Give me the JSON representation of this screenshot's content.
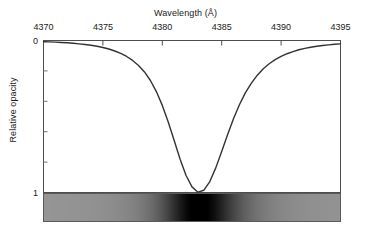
{
  "chart_data": {
    "type": "line",
    "title": "",
    "xlabel": "Wavelength (Å)",
    "ylabel": "Relative opacity",
    "xlim": [
      4370,
      4395
    ],
    "ylim": [
      0,
      1
    ],
    "y_axis_inverted": true,
    "grid": false,
    "legend": null,
    "x_tick_labels": [
      "4370",
      "4375",
      "4380",
      "4385",
      "4390",
      "4395"
    ],
    "x_ticks": [
      4370,
      4375,
      4380,
      4385,
      4390,
      4395
    ],
    "x_ticks_position": "top",
    "y_tick_labels": [
      "0",
      "1"
    ],
    "y_ticks": [
      0,
      1
    ],
    "y_minor_ticks": [
      0.2,
      0.4,
      0.6,
      0.8
    ],
    "line_color": "#333333",
    "series": [
      {
        "name": "Relative opacity",
        "line_center": 4383.0,
        "peak_opacity": 1.0,
        "x": [
          4370.0,
          4370.5,
          4371.0,
          4371.5,
          4372.0,
          4372.5,
          4373.0,
          4373.5,
          4374.0,
          4374.5,
          4375.0,
          4375.5,
          4376.0,
          4376.5,
          4377.0,
          4377.5,
          4378.0,
          4378.5,
          4379.0,
          4379.5,
          4380.0,
          4380.5,
          4381.0,
          4381.5,
          4382.0,
          4382.5,
          4383.0,
          4383.5,
          4384.0,
          4384.5,
          4385.0,
          4385.5,
          4386.0,
          4386.5,
          4387.0,
          4387.5,
          4388.0,
          4388.5,
          4389.0,
          4389.5,
          4390.0,
          4390.5,
          4391.0,
          4391.5,
          4392.0,
          4392.5,
          4393.0,
          4393.5,
          4394.0,
          4394.5,
          4395.0
        ],
        "values": [
          0.008,
          0.009,
          0.011,
          0.013,
          0.015,
          0.018,
          0.022,
          0.026,
          0.031,
          0.038,
          0.046,
          0.056,
          0.069,
          0.085,
          0.105,
          0.131,
          0.164,
          0.207,
          0.263,
          0.336,
          0.427,
          0.536,
          0.658,
          0.781,
          0.888,
          0.963,
          0.998,
          0.985,
          0.928,
          0.838,
          0.73,
          0.618,
          0.513,
          0.421,
          0.343,
          0.28,
          0.228,
          0.186,
          0.153,
          0.126,
          0.104,
          0.087,
          0.073,
          0.061,
          0.052,
          0.044,
          0.038,
          0.033,
          0.029,
          0.025,
          0.022
        ]
      }
    ],
    "spectrum_strip": {
      "description": "grayscale absorption spectrum band",
      "x_start": 4370,
      "x_end": 4395,
      "band_center": 4383.0,
      "base_gray": "#8a8a8a",
      "darkest_gray": "#000000"
    }
  }
}
